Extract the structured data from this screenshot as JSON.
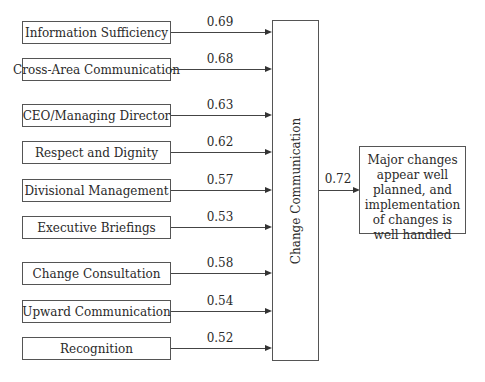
{
  "diagram": {
    "predictors": [
      {
        "label": "Information Sufficiency",
        "coef": "0.69"
      },
      {
        "label": "Cross-Area Communication",
        "coef": "0.68"
      },
      {
        "label": "CEO/Managing Director",
        "coef": "0.63"
      },
      {
        "label": "Respect and Dignity",
        "coef": "0.62"
      },
      {
        "label": "Divisional Management",
        "coef": "0.57"
      },
      {
        "label": "Executive Briefings",
        "coef": "0.53"
      },
      {
        "label": "Change Consultation",
        "coef": "0.58"
      },
      {
        "label": "Upward Communication",
        "coef": "0.54"
      },
      {
        "label": "Recognition",
        "coef": "0.52"
      }
    ],
    "central": {
      "label": "Change Communication"
    },
    "outcome_coef": "0.72",
    "outcome": {
      "lines": [
        "Major changes",
        "appear well",
        "planned, and",
        "implementation",
        "of changes is",
        "well handled"
      ]
    }
  }
}
